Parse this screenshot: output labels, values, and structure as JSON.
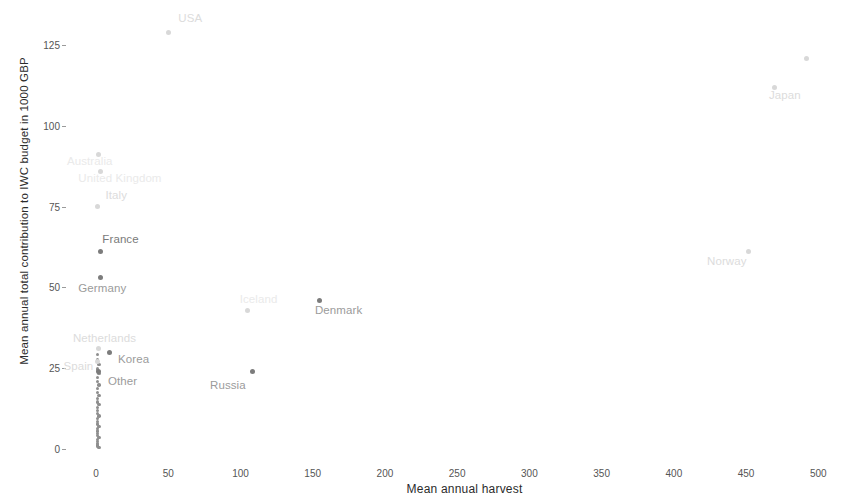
{
  "chart_data": {
    "type": "scatter",
    "title": "",
    "xlabel": "Mean annual harvest",
    "ylabel": "Mean annual total contribution to IWC budget in 1000 GBP",
    "xlim": [
      -18,
      515
    ],
    "ylim": [
      -4,
      134
    ],
    "xticks": [
      0,
      50,
      100,
      150,
      200,
      250,
      300,
      350,
      400,
      450,
      500
    ],
    "xticklabels": [
      "0",
      "50",
      "100",
      "150",
      "200",
      "250",
      "300",
      "350",
      "400",
      "450",
      "500"
    ],
    "yticks": [
      0,
      25,
      50,
      75,
      100,
      125
    ],
    "yticklabels": [
      "0",
      "25",
      "50",
      "75",
      "100",
      "125"
    ],
    "grid": false,
    "legend": "none",
    "marker_color": "#7c7c7c",
    "label_color": "#9b9b9b",
    "points": [
      {
        "label": "USA",
        "x": 50,
        "y": 129,
        "label_dx": 10,
        "label_dy": -13,
        "tone": "faint"
      },
      {
        "label": "Japan",
        "x": 470,
        "y": 112,
        "label_dx": -6,
        "label_dy": 9,
        "tone": "faint"
      },
      {
        "label": "",
        "x": 492,
        "y": 121,
        "label_dx": 0,
        "label_dy": 0,
        "tone": "faint"
      },
      {
        "label": "Australia",
        "x": 2,
        "y": 91,
        "label_dx": -32,
        "label_dy": 7,
        "tone": "vfaint"
      },
      {
        "label": "United Kingdom",
        "x": 3,
        "y": 86,
        "label_dx": -22,
        "label_dy": 8,
        "tone": "vfaint"
      },
      {
        "label": "Italy",
        "x": 1,
        "y": 75,
        "label_dx": 8,
        "label_dy": -11,
        "tone": "faint"
      },
      {
        "label": "France",
        "x": 3,
        "y": 61,
        "label_dx": 2,
        "label_dy": -12,
        "tone": "dark"
      },
      {
        "label": "Norway",
        "x": 452,
        "y": 61,
        "label_dx": -42,
        "label_dy": 10,
        "tone": "faint"
      },
      {
        "label": "Germany",
        "x": 3,
        "y": 53,
        "label_dx": -22,
        "label_dy": 11,
        "tone": "normal"
      },
      {
        "label": "Denmark",
        "x": 155,
        "y": 46,
        "label_dx": -5,
        "label_dy": 11,
        "tone": "normal"
      },
      {
        "label": "Iceland",
        "x": 105,
        "y": 43,
        "label_dx": -8,
        "label_dy": -10,
        "tone": "vfaint"
      },
      {
        "label": "Netherlands",
        "x": 2,
        "y": 31,
        "label_dx": -26,
        "label_dy": -10,
        "tone": "faint"
      },
      {
        "label": "Korea",
        "x": 9,
        "y": 30,
        "label_dx": 9,
        "label_dy": 8,
        "tone": "normal"
      },
      {
        "label": "Spain",
        "x": 1,
        "y": 27,
        "label_dx": -34,
        "label_dy": 5,
        "tone": "faint"
      },
      {
        "label": "Other",
        "x": 2,
        "y": 24,
        "label_dx": 9,
        "label_dy": 10,
        "tone": "normal"
      },
      {
        "label": "Russia",
        "x": 108,
        "y": 24,
        "label_dx": -42,
        "label_dy": 14,
        "tone": "normal"
      }
    ],
    "unlabeled_cluster_note": "dense column of small markers near x=0",
    "unlabeled_points": [
      {
        "x": 1,
        "y": 29.2
      },
      {
        "x": 1,
        "y": 27.6
      },
      {
        "x": 2,
        "y": 26.2
      },
      {
        "x": 1,
        "y": 24.8
      },
      {
        "x": 2,
        "y": 23.4
      },
      {
        "x": 1,
        "y": 22.1
      },
      {
        "x": 1,
        "y": 20.9
      },
      {
        "x": 2,
        "y": 19.8
      },
      {
        "x": 1,
        "y": 18.7
      },
      {
        "x": 1,
        "y": 17.6
      },
      {
        "x": 2,
        "y": 16.6
      },
      {
        "x": 1,
        "y": 15.6
      },
      {
        "x": 1,
        "y": 14.6
      },
      {
        "x": 2,
        "y": 13.7
      },
      {
        "x": 1,
        "y": 12.8
      },
      {
        "x": 1,
        "y": 11.9
      },
      {
        "x": 1,
        "y": 11.0
      },
      {
        "x": 2,
        "y": 10.2
      },
      {
        "x": 1,
        "y": 9.4
      },
      {
        "x": 1,
        "y": 8.6
      },
      {
        "x": 1,
        "y": 7.8
      },
      {
        "x": 2,
        "y": 7.0
      },
      {
        "x": 1,
        "y": 6.3
      },
      {
        "x": 1,
        "y": 5.6
      },
      {
        "x": 1,
        "y": 4.9
      },
      {
        "x": 1,
        "y": 4.2
      },
      {
        "x": 2,
        "y": 3.6
      },
      {
        "x": 1,
        "y": 3.0
      },
      {
        "x": 1,
        "y": 2.4
      },
      {
        "x": 1,
        "y": 1.8
      },
      {
        "x": 1,
        "y": 1.3
      },
      {
        "x": 1,
        "y": 0.8
      },
      {
        "x": 2,
        "y": 0.4
      }
    ]
  }
}
